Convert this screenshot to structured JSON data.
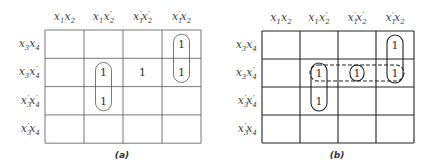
{
  "maps": [
    {
      "id": "a",
      "caption": "(a)",
      "col_headers": [
        {
          "a": "x",
          "as": "1",
          "ap": "",
          "b": "x",
          "bs": "2",
          "bp": ""
        },
        {
          "a": "x",
          "as": "1",
          "ap": "",
          "b": "x",
          "bs": "2",
          "bp": "′"
        },
        {
          "a": "x",
          "as": "1",
          "ap": "′",
          "b": "x",
          "bs": "2",
          "bp": "′"
        },
        {
          "a": "x",
          "as": "1",
          "ap": "′",
          "b": "x",
          "bs": "2",
          "bp": ""
        }
      ],
      "row_headers": [
        {
          "a": "x",
          "as": "3",
          "ap": "",
          "b": "x",
          "bs": "4",
          "bp": ""
        },
        {
          "a": "x",
          "as": "3",
          "ap": "",
          "b": "x",
          "bs": "4",
          "bp": "′"
        },
        {
          "a": "x",
          "as": "3",
          "ap": "′",
          "b": "x",
          "bs": "4",
          "bp": "′"
        },
        {
          "a": "x",
          "as": "3",
          "ap": "′",
          "b": "x",
          "bs": "4",
          "bp": ""
        }
      ],
      "cells": [
        [
          "",
          "",
          "",
          "1"
        ],
        [
          "",
          "1",
          "1",
          "1"
        ],
        [
          "",
          "1",
          "",
          ""
        ],
        [
          "",
          "",
          "",
          ""
        ]
      ],
      "groupings": [
        {
          "style": "solid",
          "cells": [
            [
              0,
              3
            ],
            [
              1,
              3
            ]
          ]
        },
        {
          "style": "solid",
          "cells": [
            [
              1,
              1
            ],
            [
              2,
              1
            ]
          ]
        }
      ]
    },
    {
      "id": "b",
      "caption": "(b)",
      "col_headers": [
        {
          "a": "x",
          "as": "1",
          "ap": "",
          "b": "x",
          "bs": "2",
          "bp": ""
        },
        {
          "a": "x",
          "as": "1",
          "ap": "",
          "b": "x",
          "bs": "2",
          "bp": "′"
        },
        {
          "a": "x",
          "as": "1",
          "ap": "′",
          "b": "x",
          "bs": "2",
          "bp": "′"
        },
        {
          "a": "x",
          "as": "1",
          "ap": "′",
          "b": "x",
          "bs": "2",
          "bp": ""
        }
      ],
      "row_headers": [
        {
          "a": "x",
          "as": "3",
          "ap": "",
          "b": "x",
          "bs": "4",
          "bp": ""
        },
        {
          "a": "x",
          "as": "3",
          "ap": "",
          "b": "x",
          "bs": "4",
          "bp": "′"
        },
        {
          "a": "x",
          "as": "3",
          "ap": "′",
          "b": "x",
          "bs": "4",
          "bp": "′"
        },
        {
          "a": "x",
          "as": "3",
          "ap": "′",
          "b": "x",
          "bs": "4",
          "bp": ""
        }
      ],
      "cells": [
        [
          "",
          "",
          "",
          "1"
        ],
        [
          "",
          "1",
          "1",
          "1"
        ],
        [
          "",
          "1",
          "",
          ""
        ],
        [
          "",
          "",
          "",
          ""
        ]
      ],
      "groupings": [
        {
          "style": "solid",
          "cells": [
            [
              0,
              3
            ],
            [
              1,
              3
            ]
          ]
        },
        {
          "style": "solid",
          "cells": [
            [
              1,
              1
            ],
            [
              2,
              1
            ]
          ]
        },
        {
          "style": "solid",
          "cells": [
            [
              1,
              2
            ]
          ]
        },
        {
          "style": "dashed",
          "cells": [
            [
              1,
              1
            ],
            [
              1,
              2
            ],
            [
              1,
              3
            ]
          ]
        }
      ]
    }
  ]
}
